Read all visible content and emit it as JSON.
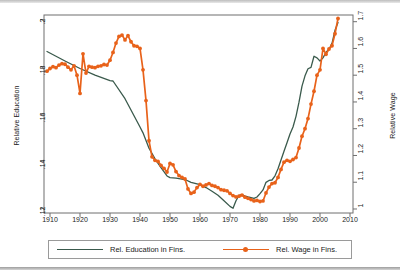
{
  "chart_data": {
    "type": "line",
    "title": "",
    "subtitle": "",
    "xlabel": "",
    "ylabel": "Relative Education",
    "y2label": "Relative Wage",
    "xlim": [
      1908,
      2011
    ],
    "ylim": [
      0.118,
      0.202
    ],
    "y2lim": [
      0.985,
      1.725
    ],
    "grid": false,
    "legend_position": "bottom",
    "xticks": [
      "1910",
      "1920",
      "1930",
      "1940",
      "1950",
      "1960",
      "1970",
      "1980",
      "1990",
      "2000",
      "2010"
    ],
    "xtick_values": [
      1910,
      1920,
      1930,
      1940,
      1950,
      1960,
      1970,
      1980,
      1990,
      2000,
      2010
    ],
    "yticks": [
      ".12",
      ".14",
      ".16",
      ".18",
      ".2"
    ],
    "ytick_values": [
      0.12,
      0.14,
      0.16,
      0.18,
      0.2
    ],
    "y2ticks": [
      "1",
      "1.1",
      "1.2",
      "1.3",
      "1.4",
      "1.5",
      "1.6",
      "1.7"
    ],
    "y2tick_values": [
      1.0,
      1.1,
      1.2,
      1.3,
      1.4,
      1.5,
      1.6,
      1.7
    ],
    "series": [
      {
        "name": "Rel. Education in Fins.",
        "axis": "left",
        "color": "#3a5a4c",
        "marker": "none",
        "x": [
          1909,
          1915,
          1920,
          1925,
          1930,
          1931,
          1935,
          1940,
          1941,
          1943,
          1945,
          1947,
          1949,
          1950,
          1952,
          1955,
          1957,
          1960,
          1962,
          1964,
          1966,
          1968,
          1970,
          1971,
          1972,
          1973,
          1974,
          1975,
          1976,
          1977,
          1978,
          1979,
          1980,
          1981,
          1982,
          1983,
          1984,
          1985,
          1986,
          1987,
          1988,
          1989,
          1990,
          1991,
          1992,
          1993,
          1994,
          1995,
          1996,
          1997,
          1998,
          1999,
          2000,
          2001,
          2002,
          2003,
          2004,
          2005,
          2006
        ],
        "y": [
          0.1865,
          0.1825,
          0.1793,
          0.1765,
          0.1742,
          0.174,
          0.1665,
          0.1545,
          0.152,
          0.1455,
          0.141,
          0.1372,
          0.1337,
          0.133,
          0.1328,
          0.1322,
          0.131,
          0.13,
          0.1288,
          0.1272,
          0.1255,
          0.1232,
          0.1208,
          0.12,
          0.1232,
          0.1255,
          0.1258,
          0.1252,
          0.1248,
          0.1245,
          0.1242,
          0.1248,
          0.1262,
          0.1278,
          0.131,
          0.1318,
          0.132,
          0.1338,
          0.1368,
          0.1405,
          0.1442,
          0.1478,
          0.1515,
          0.1545,
          0.159,
          0.165,
          0.1718,
          0.1762,
          0.1792,
          0.1798,
          0.1845,
          0.1838,
          0.1825,
          0.1838,
          0.1862,
          0.1875,
          0.19,
          0.1955,
          0.1988
        ]
      },
      {
        "name": "Rel. Wage in Fins.",
        "axis": "right",
        "color": "#E8621A",
        "marker": "circle",
        "x": [
          1909,
          1910,
          1911,
          1912,
          1913,
          1914,
          1915,
          1916,
          1917,
          1918,
          1919,
          1920,
          1921,
          1922,
          1923,
          1924,
          1925,
          1926,
          1927,
          1928,
          1929,
          1930,
          1931,
          1932,
          1933,
          1934,
          1935,
          1936,
          1937,
          1938,
          1939,
          1940,
          1941,
          1942,
          1943,
          1944,
          1945,
          1946,
          1947,
          1948,
          1949,
          1950,
          1951,
          1952,
          1953,
          1954,
          1955,
          1956,
          1957,
          1958,
          1959,
          1960,
          1961,
          1962,
          1963,
          1964,
          1965,
          1966,
          1967,
          1968,
          1969,
          1970,
          1971,
          1972,
          1973,
          1974,
          1975,
          1976,
          1977,
          1978,
          1979,
          1980,
          1981,
          1982,
          1983,
          1984,
          1985,
          1986,
          1987,
          1988,
          1989,
          1990,
          1991,
          1992,
          1993,
          1994,
          1995,
          1996,
          1997,
          1998,
          1999,
          2000,
          2001,
          2002,
          2003,
          2004,
          2005,
          2006
        ],
        "y": [
          1.515,
          1.525,
          1.532,
          1.528,
          1.538,
          1.543,
          1.541,
          1.53,
          1.52,
          1.535,
          1.5,
          1.432,
          1.58,
          1.508,
          1.533,
          1.53,
          1.528,
          1.533,
          1.535,
          1.54,
          1.538,
          1.556,
          1.585,
          1.62,
          1.645,
          1.65,
          1.632,
          1.648,
          1.625,
          1.61,
          1.608,
          1.6,
          1.52,
          1.405,
          1.255,
          1.195,
          1.182,
          1.178,
          1.163,
          1.152,
          1.138,
          1.17,
          1.165,
          1.14,
          1.125,
          1.118,
          1.112,
          1.075,
          1.058,
          1.063,
          1.08,
          1.092,
          1.085,
          1.09,
          1.095,
          1.088,
          1.085,
          1.08,
          1.072,
          1.07,
          1.068,
          1.058,
          1.05,
          1.045,
          1.048,
          1.052,
          1.044,
          1.04,
          1.035,
          1.03,
          1.032,
          1.028,
          1.03,
          1.06,
          1.082,
          1.095,
          1.098,
          1.118,
          1.148,
          1.175,
          1.182,
          1.178,
          1.185,
          1.192,
          1.228,
          1.272,
          1.3,
          1.338,
          1.392,
          1.44,
          1.5,
          1.52,
          1.6,
          1.578,
          1.598,
          1.61,
          1.655,
          1.712
        ]
      }
    ]
  },
  "legend": {
    "entries": [
      {
        "label": "Rel. Education in Fins.",
        "color": "#3a5a4c",
        "marker": "none"
      },
      {
        "label": "Rel. Wage in Fins.",
        "color": "#E8621A",
        "marker": "circle"
      }
    ]
  }
}
